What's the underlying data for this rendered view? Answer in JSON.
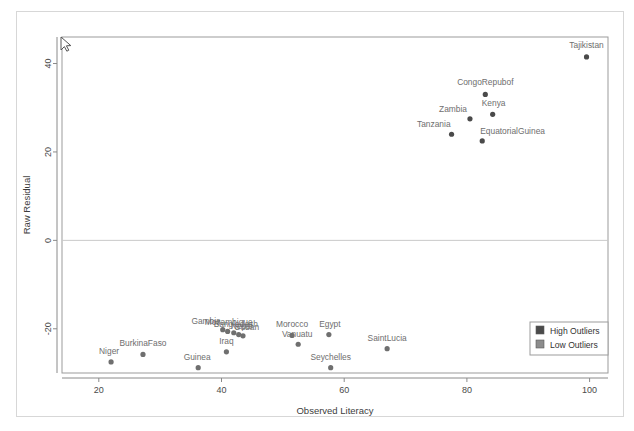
{
  "chart_data": {
    "type": "scatter",
    "title": "",
    "xlabel": "Observed Literacy",
    "ylabel": "Raw Residual",
    "xlim": [
      14,
      103
    ],
    "ylim": [
      -30,
      46
    ],
    "xticks": [
      20,
      40,
      60,
      80,
      100
    ],
    "yticks": [
      40,
      20,
      0,
      -20
    ],
    "grid": false,
    "reference_lines": [
      {
        "axis": "y",
        "value": 0
      }
    ],
    "legend": {
      "position": "bottom-right",
      "entries": [
        {
          "label": "High Outliers",
          "color": "#4a4a4a",
          "marker": "square"
        },
        {
          "label": "Low Outliers",
          "color": "#8c8c8c",
          "marker": "square"
        }
      ]
    },
    "series": [
      {
        "name": "High Outliers",
        "color": "#4a4a4a",
        "points": [
          {
            "label": "Tajikistan",
            "x": 99.5,
            "y": 41.5,
            "label_dx": 0,
            "label_dy": -9,
            "label_anchor": "middle"
          },
          {
            "label": "CongoRepubof",
            "x": 83.0,
            "y": 33.0,
            "label_dx": 0,
            "label_dy": -9,
            "label_anchor": "middle"
          },
          {
            "label": "Kenya",
            "x": 84.2,
            "y": 28.5,
            "label_dx": 1,
            "label_dy": -8,
            "label_anchor": "middle"
          },
          {
            "label": "Zambia",
            "x": 80.5,
            "y": 27.5,
            "label_dx": -3,
            "label_dy": -7,
            "label_anchor": "end"
          },
          {
            "label": "Tanzania",
            "x": 77.5,
            "y": 24.0,
            "label_dx": -1,
            "label_dy": -7,
            "label_anchor": "end"
          },
          {
            "label": "EquatorialGuinea",
            "x": 82.5,
            "y": 22.5,
            "label_dx": -2,
            "label_dy": -7,
            "label_anchor": "start"
          }
        ]
      },
      {
        "name": "Low Outliers",
        "color": "#6f6f6f",
        "points": [
          {
            "label": "Niger",
            "x": 22.0,
            "y": -27.5,
            "label_dx": -2,
            "label_dy": -8,
            "label_anchor": "middle"
          },
          {
            "label": "BurkinaFaso",
            "x": 27.2,
            "y": -25.8,
            "label_dx": 0,
            "label_dy": -8,
            "label_anchor": "middle"
          },
          {
            "label": "Guinea",
            "x": 36.2,
            "y": -28.8,
            "label_dx": -1,
            "label_dy": -8,
            "label_anchor": "middle"
          },
          {
            "label": "Iraq",
            "x": 40.8,
            "y": -25.2,
            "label_dx": 0,
            "label_dy": -8,
            "label_anchor": "middle"
          },
          {
            "label": "Gambia",
            "x": 40.2,
            "y": -20.2,
            "label_dx": -2,
            "label_dy": -6,
            "label_anchor": "end"
          },
          {
            "label": "Mozambique",
            "x": 41.0,
            "y": -20.6,
            "label_dx": 1,
            "label_dy": -6,
            "label_anchor": "middle"
          },
          {
            "label": "Bangladesh",
            "x": 42.0,
            "y": -20.9,
            "label_dx": 2,
            "label_dy": -6,
            "label_anchor": "middle"
          },
          {
            "label": "Nepal",
            "x": 42.8,
            "y": -21.3,
            "label_dx": 3,
            "label_dy": -6,
            "label_anchor": "middle"
          },
          {
            "label": "Sudan",
            "x": 43.5,
            "y": -21.6,
            "label_dx": 4,
            "label_dy": -6,
            "label_anchor": "middle"
          },
          {
            "label": "Morocco",
            "x": 51.5,
            "y": -21.5,
            "label_dx": 0,
            "label_dy": -8,
            "label_anchor": "middle"
          },
          {
            "label": "Vanuatu",
            "x": 52.5,
            "y": -23.5,
            "label_dx": -1,
            "label_dy": -7,
            "label_anchor": "middle"
          },
          {
            "label": "Egypt",
            "x": 57.5,
            "y": -21.3,
            "label_dx": 1,
            "label_dy": -8,
            "label_anchor": "middle"
          },
          {
            "label": "Seychelles",
            "x": 57.8,
            "y": -28.8,
            "label_dx": 0,
            "label_dy": -8,
            "label_anchor": "middle"
          },
          {
            "label": "SaintLucia",
            "x": 67.0,
            "y": -24.5,
            "label_dx": 0,
            "label_dy": -8,
            "label_anchor": "middle"
          }
        ]
      }
    ]
  },
  "cursor": {
    "name": "mouse-pointer",
    "x": 61,
    "y": 37
  }
}
